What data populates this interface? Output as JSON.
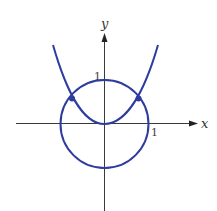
{
  "diagram": {
    "axes": {
      "x_label": "x",
      "y_label": "y",
      "x_tick_label": "1",
      "y_tick_label": "1",
      "color": "#3a3a3a"
    },
    "curves": [
      {
        "name": "unit-circle",
        "equation": "x^2 + y^2 = 1",
        "color": "#2e3c9e"
      },
      {
        "name": "parabola",
        "equation": "y = x^2",
        "color": "#2e3c9e"
      }
    ],
    "intersection_points": [
      {
        "x": -0.79,
        "y": 0.62
      },
      {
        "x": 0.79,
        "y": 0.62
      }
    ]
  }
}
